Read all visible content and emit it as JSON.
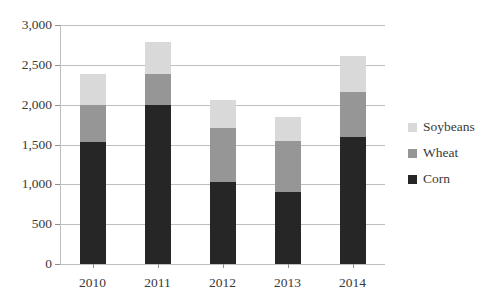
{
  "chart_data": {
    "type": "bar",
    "stacked": true,
    "title": "",
    "xlabel": "",
    "ylabel": "",
    "categories": [
      "2010",
      "2011",
      "2012",
      "2013",
      "2014"
    ],
    "series": [
      {
        "name": "Corn",
        "color": "#262626",
        "values": [
          1530,
          1990,
          1030,
          900,
          1600
        ]
      },
      {
        "name": "Wheat",
        "color": "#969696",
        "values": [
          470,
          390,
          680,
          650,
          560
        ]
      },
      {
        "name": "Soybeans",
        "color": "#d9d9d9",
        "values": [
          390,
          410,
          350,
          300,
          450
        ]
      }
    ],
    "totals": [
      2390,
      2790,
      2060,
      1850,
      2610
    ],
    "ylim": [
      0,
      3000
    ],
    "ytick_step": 500,
    "yticks": [
      0,
      500,
      1000,
      1500,
      2000,
      2500,
      3000
    ],
    "ytick_labels": [
      "0",
      "500",
      "1,000",
      "1,500",
      "2,000",
      "2,500",
      "3,000"
    ],
    "grid": true,
    "legend_position": "right",
    "legend_order": [
      "Soybeans",
      "Wheat",
      "Corn"
    ]
  }
}
